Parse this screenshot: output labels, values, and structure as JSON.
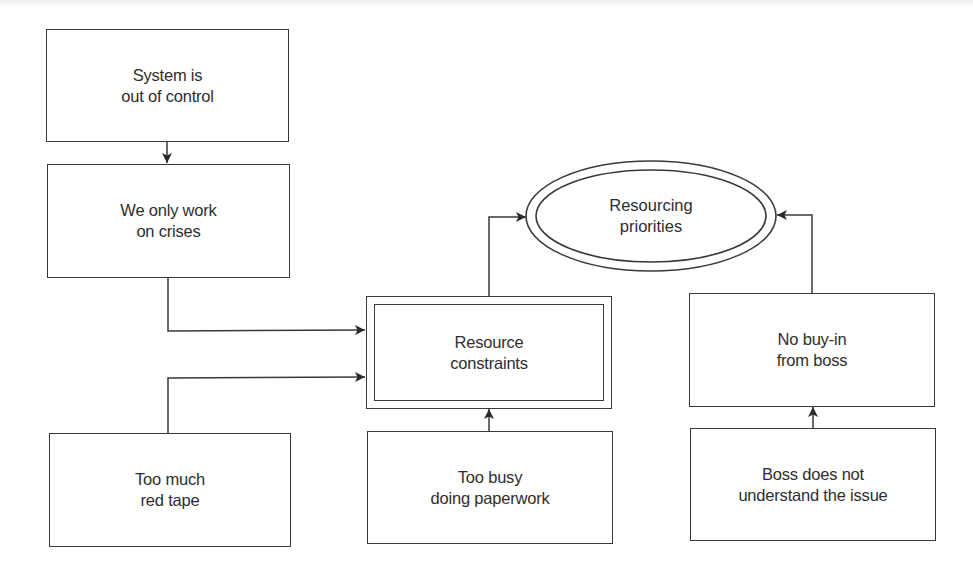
{
  "diagram": {
    "type": "cause-and-effect flowchart",
    "colors": {
      "stroke": "#3a3a3a",
      "text": "#2e2e2e",
      "background": "#ffffff"
    },
    "nodes": {
      "system_out_of_control": {
        "label": "System is\nout of control",
        "shape": "rectangle"
      },
      "work_on_crises": {
        "label": "We only work\non crises",
        "shape": "rectangle"
      },
      "red_tape": {
        "label": "Too much\nred tape",
        "shape": "rectangle"
      },
      "resource_constraints": {
        "label": "Resource\nconstraints",
        "shape": "double-rectangle"
      },
      "paperwork": {
        "label": "Too busy\ndoing paperwork",
        "shape": "rectangle"
      },
      "resourcing_priorities": {
        "label": "Resourcing\npriorities",
        "shape": "double-ellipse"
      },
      "no_buy_in": {
        "label": "No buy-in\nfrom boss",
        "shape": "rectangle"
      },
      "boss_not_understand": {
        "label": "Boss does not\nunderstand the issue",
        "shape": "rectangle"
      }
    },
    "edges": [
      {
        "from": "system_out_of_control",
        "to": "work_on_crises"
      },
      {
        "from": "work_on_crises",
        "to": "resource_constraints"
      },
      {
        "from": "red_tape",
        "to": "resource_constraints"
      },
      {
        "from": "paperwork",
        "to": "resource_constraints"
      },
      {
        "from": "resource_constraints",
        "to": "resourcing_priorities"
      },
      {
        "from": "boss_not_understand",
        "to": "no_buy_in"
      },
      {
        "from": "no_buy_in",
        "to": "resourcing_priorities"
      }
    ]
  }
}
